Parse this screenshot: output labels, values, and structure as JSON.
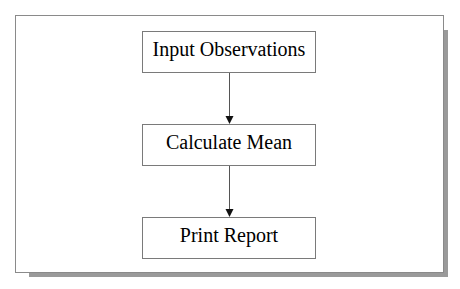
{
  "diagram": {
    "type": "flowchart",
    "direction": "top-to-bottom",
    "nodes": [
      {
        "id": "input",
        "label": "Input Observations"
      },
      {
        "id": "mean",
        "label": "Calculate Mean"
      },
      {
        "id": "report",
        "label": "Print Report"
      }
    ],
    "edges": [
      {
        "from": "input",
        "to": "mean"
      },
      {
        "from": "mean",
        "to": "report"
      }
    ]
  },
  "colors": {
    "background": "#ffffff",
    "frame_border": "#8a8a8a",
    "shadow": "#9a9a9a",
    "node_border": "#7a7a7a",
    "arrow": "#333333",
    "text": "#000000"
  }
}
